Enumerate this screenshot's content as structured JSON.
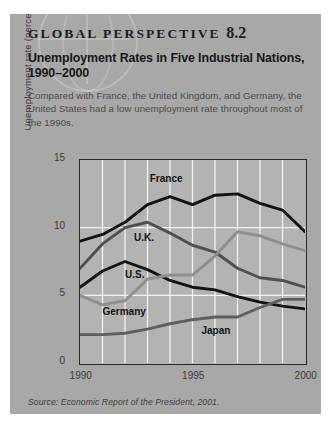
{
  "card": {
    "eyebrow": "GLOBAL PERSPECTIVE",
    "eyebrow_number": "8.2",
    "title": "Unemployment Rates in Five Industrial Nations, 1990–2000",
    "description": "Compared with France, the United Kingdom, and Germany, the United States had a low unemployment rate throughout most of the 1990s.",
    "source": "Source: Economic Report of the President, 2001."
  },
  "chart_data": {
    "type": "line",
    "title": "Unemployment Rates in Five Industrial Nations, 1990–2000",
    "xlabel": "",
    "ylabel": "Unemployment rate (percent)",
    "xlim": [
      1990,
      2000
    ],
    "ylim": [
      0,
      15
    ],
    "yticks": [
      0,
      5,
      10,
      15
    ],
    "xticks": [
      1990,
      1995,
      2000
    ],
    "xtick_labels": [
      "1990",
      "1995",
      "2000"
    ],
    "ytick_labels": [
      "0",
      "5",
      "10",
      "15"
    ],
    "grid": "vertical-and-horizontal-white",
    "legend": "inline-labels",
    "x": [
      1990,
      1991,
      1992,
      1993,
      1994,
      1995,
      1996,
      1997,
      1998,
      1999,
      2000
    ],
    "series": [
      {
        "name": "France",
        "color": "#121212",
        "values": [
          9.0,
          9.5,
          10.4,
          11.7,
          12.3,
          11.7,
          12.4,
          12.5,
          11.8,
          11.3,
          9.7
        ],
        "label": "France"
      },
      {
        "name": "U.K.",
        "color": "#4f4f4f",
        "values": [
          7.0,
          8.8,
          10.0,
          10.4,
          9.6,
          8.7,
          8.2,
          7.0,
          6.3,
          6.1,
          5.6
        ],
        "label": "U.K."
      },
      {
        "name": "U.S.",
        "color": "#121212",
        "values": [
          5.6,
          6.8,
          7.5,
          6.9,
          6.1,
          5.6,
          5.4,
          4.9,
          4.5,
          4.2,
          4.0
        ],
        "label": "U.S."
      },
      {
        "name": "Germany",
        "color": "#8f8f8d",
        "values": [
          5.0,
          4.3,
          4.6,
          6.2,
          6.5,
          6.5,
          7.9,
          9.7,
          9.4,
          8.8,
          8.3
        ],
        "label": "Germany"
      },
      {
        "name": "Japan",
        "color": "#5e5e5e",
        "values": [
          2.1,
          2.1,
          2.2,
          2.5,
          2.9,
          3.2,
          3.4,
          3.4,
          4.1,
          4.7,
          4.7
        ],
        "label": "Japan"
      }
    ],
    "inline_labels": [
      {
        "text": "France",
        "x": 1993.1,
        "y": 13.35
      },
      {
        "text": "U.K.",
        "x": 1992.4,
        "y": 9.05
      },
      {
        "text": "U.S.",
        "x": 1992.0,
        "y": 6.25
      },
      {
        "text": "Germany",
        "x": 1991.0,
        "y": 3.55
      },
      {
        "text": "Japan",
        "x": 1995.4,
        "y": 2.15
      }
    ]
  }
}
